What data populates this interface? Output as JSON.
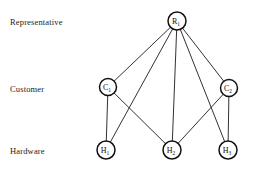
{
  "figure": {
    "type": "node-link-diagram",
    "width": 257,
    "height": 172,
    "background_color": "#ffffff",
    "line_color": "#1b1b1b",
    "node_fill_color": "#ffffff",
    "node_stroke_color": "#101010"
  },
  "row_labels": [
    {
      "id": "representative",
      "text": "Representative",
      "y": 21
    },
    {
      "id": "customer",
      "text": "Customer",
      "y": 88
    },
    {
      "id": "hardware",
      "text": "Hardware",
      "y": 150
    }
  ],
  "nodes": [
    {
      "id": "R1",
      "base": "R",
      "sub": "1",
      "cx": 177,
      "cy": 21,
      "r": 9,
      "layer": "representative"
    },
    {
      "id": "C1",
      "base": "C",
      "sub": "1",
      "cx": 108,
      "cy": 87,
      "r": 8.5,
      "layer": "customer"
    },
    {
      "id": "C2",
      "base": "C",
      "sub": "2",
      "cx": 229,
      "cy": 88,
      "r": 8.5,
      "layer": "customer"
    },
    {
      "id": "H1",
      "base": "H",
      "sub": "1",
      "cx": 106,
      "cy": 150,
      "r": 9,
      "layer": "hardware"
    },
    {
      "id": "H2",
      "base": "H",
      "sub": "2",
      "cx": 172,
      "cy": 150,
      "r": 9,
      "layer": "hardware"
    },
    {
      "id": "H3",
      "base": "H",
      "sub": "3",
      "cx": 228,
      "cy": 150,
      "r": 9,
      "layer": "hardware"
    }
  ],
  "edges": [
    {
      "id": "R1-C1",
      "from": "R1",
      "to": "C1"
    },
    {
      "id": "R1-H1",
      "from": "R1",
      "to": "H1"
    },
    {
      "id": "R1-H2",
      "from": "R1",
      "to": "H2"
    },
    {
      "id": "R1-C2",
      "from": "R1",
      "to": "C2"
    },
    {
      "id": "R1-H3",
      "from": "R1",
      "to": "H3"
    },
    {
      "id": "C1-H1",
      "from": "C1",
      "to": "H1"
    },
    {
      "id": "C1-H2",
      "from": "C1",
      "to": "H2"
    },
    {
      "id": "C2-H2",
      "from": "C2",
      "to": "H2"
    },
    {
      "id": "C2-H3",
      "from": "C2",
      "to": "H3"
    }
  ]
}
